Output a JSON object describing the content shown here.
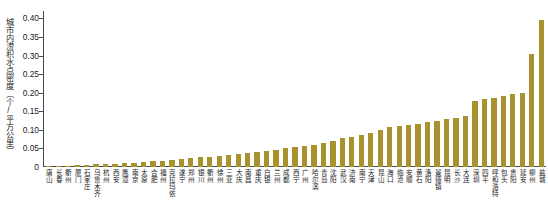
{
  "chart_data": {
    "type": "bar",
    "title": "",
    "xlabel": "",
    "ylabel": "城市内涝积水点密度（个/平方公里）",
    "ylim": [
      0,
      0.42
    ],
    "ytick_labels": [
      "0",
      "0.05",
      "0.10",
      "0.15",
      "0.20",
      "0.25",
      "0.30",
      "0.35",
      "0.40"
    ],
    "ytick_values": [
      0,
      0.05,
      0.1,
      0.15,
      0.2,
      0.25,
      0.3,
      0.35,
      0.4
    ],
    "grid": false,
    "legend": "none",
    "bar_color": "#A8922E",
    "axis_color": "#4a4a4a",
    "categories": [
      "唐山",
      "长春",
      "衢州",
      "厦门",
      "石家庄",
      "乌鲁木齐",
      "杭州",
      "西安",
      "鹰潭",
      "南京",
      "太原",
      "合肥",
      "福州",
      "克拉玛依",
      "遂宁",
      "郑州",
      "银川",
      "衢州",
      "徐州",
      "三亚",
      "大庆",
      "南昌",
      "重庆",
      "白银",
      "兰州",
      "成都",
      "西宁",
      "广州",
      "哈尔滨",
      "青岛",
      "沈阳",
      "武汉",
      "济南",
      "南宁",
      "天津",
      "昆山",
      "海口",
      "临沧",
      "安顺",
      "黄石",
      "洛阳",
      "景德镇",
      "昆明",
      "长沙",
      "大连",
      "深圳",
      "四平",
      "呼和浩特",
      "包头",
      "贵阳",
      "延安",
      "柳州",
      "盐城"
    ],
    "values": [
      0.002,
      0.003,
      0.004,
      0.005,
      0.006,
      0.007,
      0.008,
      0.009,
      0.01,
      0.011,
      0.013,
      0.015,
      0.017,
      0.019,
      0.021,
      0.024,
      0.026,
      0.028,
      0.03,
      0.033,
      0.036,
      0.039,
      0.041,
      0.044,
      0.047,
      0.05,
      0.053,
      0.056,
      0.06,
      0.065,
      0.07,
      0.078,
      0.082,
      0.087,
      0.092,
      0.1,
      0.108,
      0.11,
      0.112,
      0.116,
      0.12,
      0.124,
      0.128,
      0.133,
      0.138,
      0.178,
      0.183,
      0.186,
      0.192,
      0.196,
      0.2,
      0.305,
      0.395
    ]
  }
}
